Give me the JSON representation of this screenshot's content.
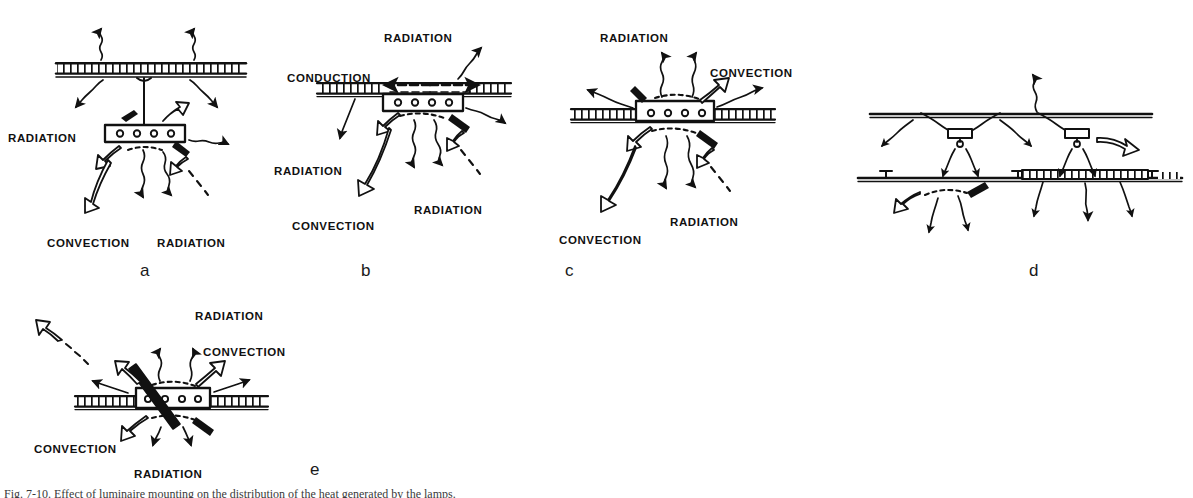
{
  "figure": {
    "caption": "Fig. 7-10.  Effect of luminaire mounting on the distribution of the heat generated by the lamps.",
    "ink_color": "#111111",
    "background_color": "#ffffff"
  },
  "panels": [
    {
      "id": "a",
      "letter": "a",
      "name": "suspended-pendant-luminaire",
      "labels": [
        {
          "text": "RADIATION",
          "x": 8,
          "y": 133
        },
        {
          "text": "CONVECTION",
          "x": 47,
          "y": 238
        },
        {
          "text": "RADIATION",
          "x": 157,
          "y": 238
        }
      ]
    },
    {
      "id": "b",
      "letter": "b",
      "name": "surface-mounted-luminaire",
      "labels": [
        {
          "text": "RADIATION",
          "x": 384,
          "y": 33
        },
        {
          "text": "CONDUCTION",
          "x": 287,
          "y": 73
        },
        {
          "text": "RADIATION",
          "x": 274,
          "y": 166
        },
        {
          "text": "CONVECTION",
          "x": 292,
          "y": 221
        },
        {
          "text": "RADIATION",
          "x": 414,
          "y": 205
        }
      ]
    },
    {
      "id": "c",
      "letter": "c",
      "name": "recessed-luminaire",
      "labels": [
        {
          "text": "RADIATION",
          "x": 600,
          "y": 33
        },
        {
          "text": "CONVECTION",
          "x": 710,
          "y": 68
        },
        {
          "text": "CONVECTION",
          "x": 559,
          "y": 235
        },
        {
          "text": "RADIATION",
          "x": 670,
          "y": 217
        }
      ]
    },
    {
      "id": "d",
      "letter": "d",
      "name": "plenum-mounted-luminaires",
      "labels": []
    },
    {
      "id": "e",
      "letter": "e",
      "name": "air-handling-luminaire",
      "labels": [
        {
          "text": "RADIATION",
          "x": 195,
          "y": 311
        },
        {
          "text": "CONVECTION",
          "x": 203,
          "y": 347
        },
        {
          "text": "CONVECTION",
          "x": 34,
          "y": 444
        },
        {
          "text": "RADIATION",
          "x": 134,
          "y": 469
        }
      ]
    }
  ],
  "panel_letters": [
    {
      "letter": "a",
      "x": 140,
      "y": 262
    },
    {
      "letter": "b",
      "x": 361,
      "y": 262
    },
    {
      "letter": "c",
      "x": 565,
      "y": 262
    },
    {
      "letter": "d",
      "x": 1029,
      "y": 262
    },
    {
      "letter": "e",
      "x": 310,
      "y": 461
    }
  ],
  "legend": {
    "radiation_arrow": "wavy-line-with-solid-head",
    "convection_arrow": "curved-hollow-outline-arrow",
    "conduction_arrow": "straight-dashed-with-solid-head",
    "ceiling": "hatched-band",
    "luminaire": "rectangle-with-four-lamp-circles"
  }
}
